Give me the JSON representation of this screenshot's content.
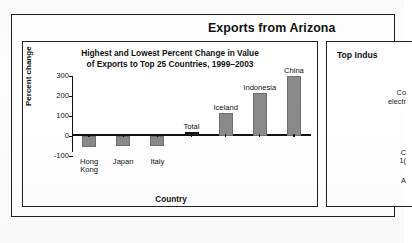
{
  "document": {
    "section_heading": "Exports from Arizona"
  },
  "left_panel": {
    "title_line1": "Highest and Lowest Percent Change in Value",
    "title_line2": "of Exports to Top 25 Countries, 1999–2003"
  },
  "right_panel": {
    "title_clipped": "Top Indus",
    "body_clipped": [
      "Co",
      "electr",
      "C",
      "1(",
      "A"
    ]
  },
  "chart_data": {
    "type": "bar",
    "title": "Highest and Lowest Percent Change in Value of Exports to Top 25 Countries, 1999–2003",
    "xlabel": "Country",
    "ylabel": "Percent change",
    "categories": [
      "Hong Kong",
      "Japan",
      "Italy",
      "Total",
      "Iceland",
      "Indonesia",
      "China"
    ],
    "values": [
      -55,
      -50,
      -48,
      20,
      115,
      215,
      300
    ],
    "ylim": [
      -100,
      300
    ],
    "yticks": [
      300,
      200,
      100,
      0,
      -100
    ],
    "ytick_labels": [
      "300",
      "200",
      "100",
      "0",
      "-100"
    ],
    "grid": false,
    "legend": "none",
    "colors": {
      "bar": "#8a8a8a",
      "bar_total": "#1b1b1b",
      "axis": "#111111"
    }
  }
}
